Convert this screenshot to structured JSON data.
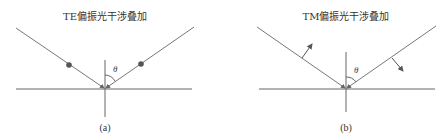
{
  "panels": [
    {
      "id": "a",
      "title": "TE偏振光干涉叠加",
      "caption": "(a)",
      "angle_label": "θ",
      "polarization_marker": "dot"
    },
    {
      "id": "b",
      "title": "TM偏振光干涉叠加",
      "caption": "(b)",
      "angle_label": "θ",
      "polarization_marker": "arrow"
    }
  ],
  "colors": {
    "line": "#666666",
    "dot": "#555555",
    "text": "#333333"
  }
}
